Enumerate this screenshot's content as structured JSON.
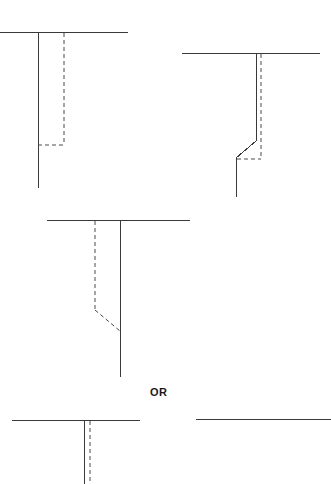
{
  "figure": {
    "background_color": "#ffffff",
    "stroke_color": "#3a3a3a",
    "dashed_color": "#4a4a4a",
    "stroke_width": 1,
    "dash_pattern": "4 3",
    "width": 331,
    "height": 484
  },
  "connector": {
    "label": "OR",
    "x": 160,
    "y": 393
  },
  "panels": [
    {
      "name": "panel-top-left",
      "label": "top-left",
      "solid_paths": [
        {
          "name": "horizontal-baseline",
          "points": "0,32 128,32"
        },
        {
          "name": "vertical-solid-leg",
          "points": "38,33 38,188"
        }
      ],
      "dashed_paths": [
        {
          "name": "vertical-dashed-leg",
          "points": "64,33 64,145"
        },
        {
          "name": "horizontal-dashed-base",
          "points": "38,145 64,145"
        }
      ]
    },
    {
      "name": "panel-top-right",
      "label": "top-right",
      "solid_paths": [
        {
          "name": "horizontal-baseline",
          "points": "182,53 320,53"
        },
        {
          "name": "vertical-solid-leg-upper",
          "points": "256,54 256,141"
        },
        {
          "name": "diagonal-solid-bend",
          "points": "256,141 236,158"
        },
        {
          "name": "vertical-solid-leg-lower",
          "points": "236,158 236,197"
        }
      ],
      "dashed_paths": [
        {
          "name": "vertical-dashed-leg",
          "points": "261,54 261,159"
        },
        {
          "name": "horizontal-dashed-base",
          "points": "237,159 261,159"
        }
      ]
    },
    {
      "name": "panel-middle",
      "label": "middle",
      "solid_paths": [
        {
          "name": "horizontal-baseline",
          "points": "47,220 190,220"
        },
        {
          "name": "vertical-solid-leg",
          "points": "120,221 120,377"
        }
      ],
      "dashed_paths": [
        {
          "name": "vertical-dashed-leg",
          "points": "95,221 95,310"
        },
        {
          "name": "diagonal-dashed-bend",
          "points": "95,310 120,331"
        }
      ]
    },
    {
      "name": "panel-bottom-left",
      "label": "bottom-left",
      "solid_paths": [
        {
          "name": "horizontal-baseline",
          "points": "12,420 140,420"
        },
        {
          "name": "vertical-solid-leg",
          "points": "84,421 84,484"
        }
      ],
      "dashed_paths": [
        {
          "name": "vertical-dashed-leg",
          "points": "90,421 90,484"
        }
      ]
    },
    {
      "name": "panel-bottom-right",
      "label": "bottom-right",
      "solid_paths": [
        {
          "name": "horizontal-baseline",
          "points": "196,419 331,419"
        }
      ],
      "dashed_paths": []
    }
  ]
}
